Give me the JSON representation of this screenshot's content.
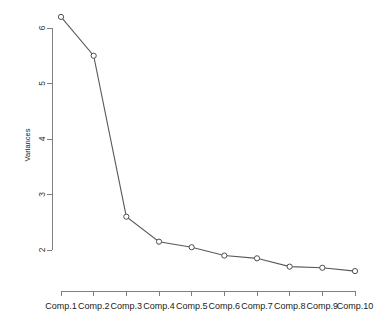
{
  "chart_data": {
    "type": "line",
    "title": "",
    "subtitle": "",
    "xlabel": "",
    "ylabel": "Variances",
    "categories": [
      "Comp.1",
      "Comp.2",
      "Comp.3",
      "Comp.4",
      "Comp.5",
      "Comp.6",
      "Comp.7",
      "Comp.8",
      "Comp.9",
      "Comp.10"
    ],
    "values": [
      6.2,
      5.5,
      2.6,
      2.15,
      2.05,
      1.9,
      1.85,
      1.7,
      1.68,
      1.62
    ],
    "series": [
      {
        "name": "Variances",
        "values": [
          6.2,
          5.5,
          2.6,
          2.15,
          2.05,
          1.9,
          1.85,
          1.7,
          1.68,
          1.62
        ]
      }
    ],
    "ylim": [
      1.55,
      6.35
    ],
    "xlim": [
      0.5,
      10.5
    ],
    "yticks": [
      2,
      3,
      4,
      5,
      6
    ],
    "ytick_labels": [
      "2",
      "3",
      "4",
      "5",
      "6"
    ],
    "grid": false,
    "legend": false,
    "legend_position": "none",
    "marker": "open-circle",
    "line_color": "#595959",
    "marker_fill": "#ffffff",
    "marker_stroke": "#4d4d4d",
    "axis_color": "#808080",
    "background_color": "#ffffff"
  },
  "ticks": {
    "y": [
      {
        "label": "6",
        "value": 6
      },
      {
        "label": "5",
        "value": 5
      },
      {
        "label": "4",
        "value": 4
      },
      {
        "label": "3",
        "value": 3
      },
      {
        "label": "2",
        "value": 2
      }
    ]
  },
  "axis": {
    "y_title": "Variances"
  }
}
